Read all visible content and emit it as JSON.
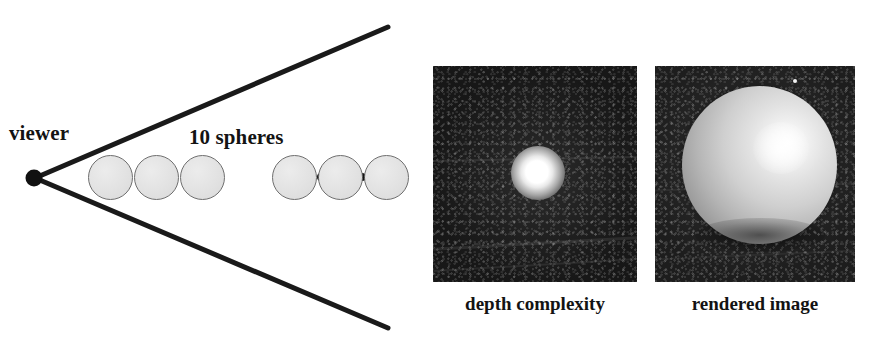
{
  "figure": {
    "background_color": "#ffffff",
    "diagram": {
      "viewer_label": "viewer",
      "spheres_label": "10 spheres",
      "sphere_count_text": "10",
      "ellipsis_dot_count": 4,
      "visible_sphere_count": 6,
      "sphere_fill_color": "#e2e2e2",
      "sphere_outline_color": "#6e6e6e",
      "ray_color": "#1a1a1a",
      "viewer_dot_color": "#111111"
    },
    "panels": [
      {
        "id": "depth-complexity",
        "caption": "depth complexity",
        "background_color": "#1b1b1b",
        "highlight_color": "#ffffff"
      },
      {
        "id": "rendered-image",
        "caption": "rendered image",
        "background_color": "#2a2a2a",
        "sphere_color": "#d8d8d8",
        "highlight_color": "#ffffff"
      }
    ]
  }
}
